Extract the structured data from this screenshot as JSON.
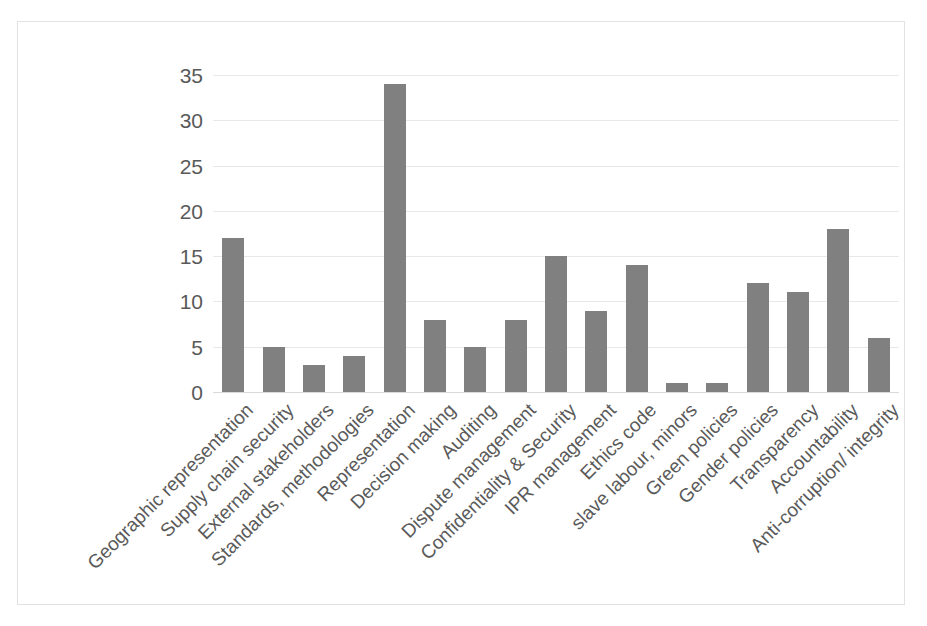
{
  "chart_data": {
    "type": "bar",
    "title": "",
    "subtitle": "",
    "xlabel": "",
    "ylabel": "",
    "ylim": [
      0,
      35
    ],
    "grid": true,
    "legend": false,
    "bar_color": "#808080",
    "gridline_color": "#e8e8e8",
    "axis_text_color": "#595959",
    "y_ticks": [
      0,
      5,
      10,
      15,
      20,
      25,
      30,
      35
    ],
    "y_tick_labels": [
      "0",
      "5",
      "10",
      "15",
      "20",
      "25",
      "30",
      "35"
    ],
    "categories": [
      "Geographic representation",
      "Supply chain security",
      "External stakeholders",
      "Standards, methodologies",
      "Representation",
      "Decision making",
      "Auditing",
      "Dispute management",
      "Confidentiality & Security",
      "IPR management",
      "Ethics code",
      "slave labour, minors",
      "Green policies",
      "Gender policies",
      "Transparency",
      "Accountability",
      "Anti-corruption/ integrity"
    ],
    "values": [
      17,
      5,
      3,
      4,
      34,
      8,
      5,
      8,
      15,
      9,
      14,
      1,
      1,
      12,
      11,
      18,
      6
    ]
  }
}
